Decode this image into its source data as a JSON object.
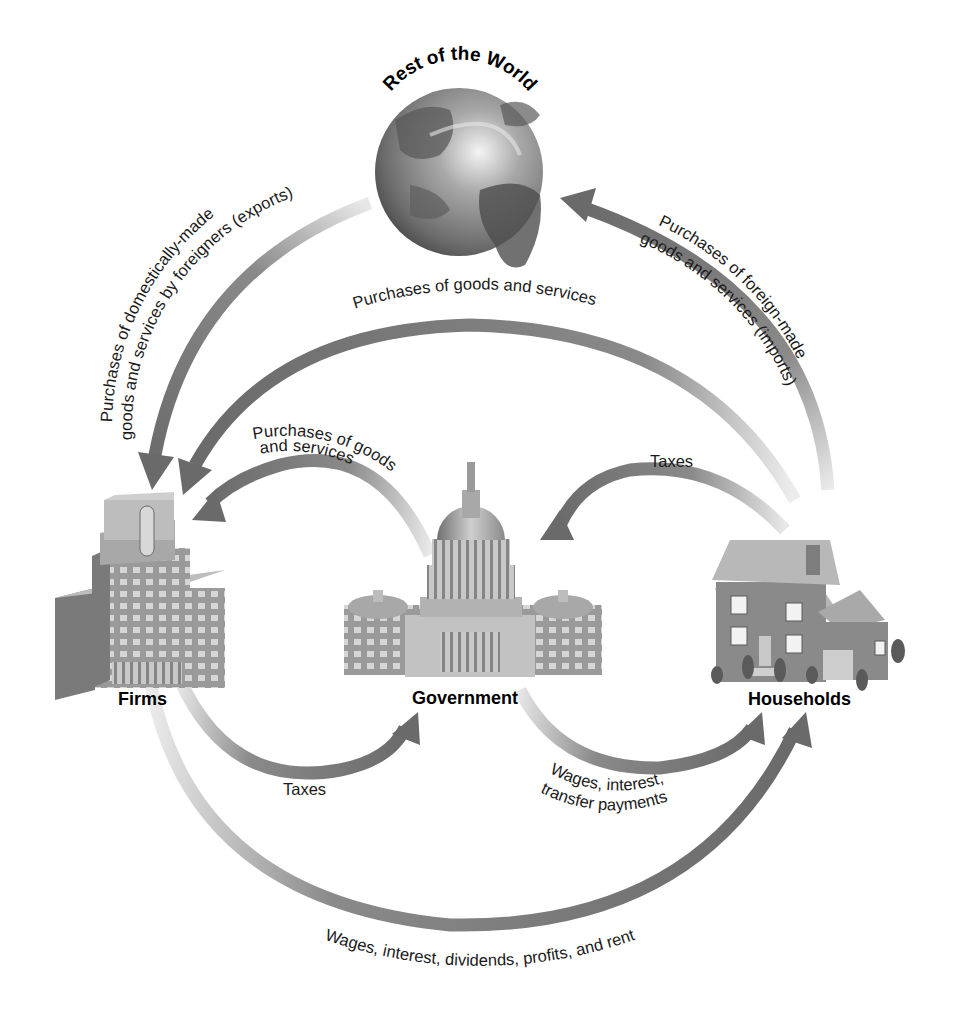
{
  "diagram": {
    "type": "circular-flow",
    "nodes": {
      "world": {
        "label": "Rest of the World",
        "icon": "globe-icon"
      },
      "firms": {
        "label": "Firms",
        "icon": "office-building-icon"
      },
      "government": {
        "label": "Government",
        "icon": "capitol-building-icon"
      },
      "households": {
        "label": "Households",
        "icon": "house-icon"
      }
    },
    "flows": [
      {
        "id": "exports",
        "from": "Rest of the World",
        "to": "Firms",
        "label_line1": "Purchases of domestically-made",
        "label_line2": "goods and services by foreigners (exports)"
      },
      {
        "id": "imports",
        "from": "Households",
        "to": "Rest of the World",
        "label_line1": "Purchases of foreign-made",
        "label_line2": "goods and services (imports)"
      },
      {
        "id": "household-purchases",
        "from": "Households",
        "to": "Firms",
        "label": "Purchases of goods and services"
      },
      {
        "id": "government-purchases",
        "from": "Government",
        "to": "Firms",
        "label_line1": "Purchases of goods",
        "label_line2": "and services"
      },
      {
        "id": "household-taxes",
        "from": "Households",
        "to": "Government",
        "label": "Taxes"
      },
      {
        "id": "firm-taxes",
        "from": "Firms",
        "to": "Government",
        "label": "Taxes"
      },
      {
        "id": "government-payments",
        "from": "Government",
        "to": "Households",
        "label_line1": "Wages, interest,",
        "label_line2": "transfer payments"
      },
      {
        "id": "factor-payments",
        "from": "Firms",
        "to": "Households",
        "label": "Wages, interest, dividends, profits, and rent"
      }
    ],
    "colors": {
      "arrow": "#6e6e6e",
      "arrow_fade": "#e4e4e4",
      "text": "#1a1a1a",
      "background": "#ffffff"
    }
  }
}
